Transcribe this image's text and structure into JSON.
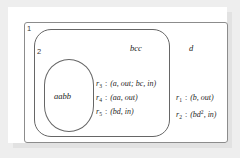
{
  "figure": {
    "type": "membrane-system-diagram",
    "membranes": [
      {
        "label": "1",
        "shape": "rectangle",
        "name": "skin-membrane",
        "objects": "d",
        "rules": [
          {
            "id": "r",
            "index": "1",
            "body": "(b, out)"
          },
          {
            "id": "r",
            "index": "2",
            "body_pre": "(bd",
            "sup": "2",
            "body_post": ", in)"
          }
        ]
      },
      {
        "label": "2",
        "shape": "rounded-rectangle",
        "name": "middle-membrane",
        "objects": "bcc",
        "rules": [
          {
            "id": "r",
            "index": "3",
            "body": "(a, out; bc, in)"
          },
          {
            "id": "r",
            "index": "4",
            "body": "(aa, out)"
          },
          {
            "id": "r",
            "index": "5",
            "body": "(bd, in)"
          }
        ]
      },
      {
        "label": "",
        "shape": "stadium",
        "name": "inner-membrane",
        "objects": "aabb",
        "rules": []
      }
    ],
    "colors": {
      "background": "#eeeeee",
      "panel": "#ffffff",
      "membrane_1_stroke": "#8c8c8c",
      "membrane_2_stroke": "#666666",
      "membrane_3_stroke": "#666666",
      "text": "#1f1f1f"
    },
    "labels": {
      "membrane_1": "1",
      "membrane_2": "2"
    },
    "objects": {
      "inner": "aabb",
      "middle": "bcc",
      "outer": "d"
    },
    "rules_inner": {
      "r3_id": "r",
      "r3_sub": "3",
      "r3_sep": " : ",
      "r3_body": "(a, out; bc, in)",
      "r4_id": "r",
      "r4_sub": "4",
      "r4_sep": " : ",
      "r4_body": "(aa, out)",
      "r5_id": "r",
      "r5_sub": "5",
      "r5_sep": " : ",
      "r5_body": "(bd, in)"
    },
    "rules_outer": {
      "r1_id": "r",
      "r1_sub": "1",
      "r1_sep": " : ",
      "r1_body": "(b, out)",
      "r2_id": "r",
      "r2_sub": "2",
      "r2_sep": " : ",
      "r2_body_pre": "(bd",
      "r2_sup": "2",
      "r2_body_post": ", in)"
    }
  }
}
